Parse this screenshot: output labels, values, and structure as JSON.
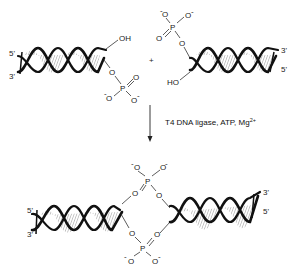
{
  "diagram": {
    "top_left_duplex": {
      "labels": {
        "five_prime": "5'",
        "three_prime": "3'"
      },
      "hydroxyl": "OH",
      "phosphate": {
        "o_bridge": "O",
        "p": "P",
        "o_double": "O",
        "o_minus_1": "O",
        "o_minus_2": "O",
        "charge": "-"
      }
    },
    "plus_sign": "+",
    "top_right_duplex": {
      "labels": {
        "three_prime": "3'",
        "five_prime": "5'"
      },
      "hydroxyl": "HO",
      "phosphate": {
        "o_bridge": "O",
        "p": "P",
        "o_double": "O",
        "o_minus_1": "O",
        "o_minus_2": "O",
        "charge": "-"
      }
    },
    "reaction": {
      "arrow": "down-arrow",
      "conditions": "T4 DNA ligase, ATP, Mg",
      "superscript": "2+"
    },
    "product": {
      "left_labels": {
        "five_prime": "5'",
        "three_prime": "3'"
      },
      "right_labels": {
        "three_prime": "3'",
        "five_prime": "5'"
      },
      "upper_phosphate": {
        "o_left": "O",
        "p": "P",
        "o_right": "O",
        "o_minus_1": "O",
        "o_minus_2": "O"
      },
      "lower_phosphate": {
        "o_left": "O",
        "p": "P",
        "o_right": "O",
        "o_minus_1": "O",
        "o_minus_2": "O"
      },
      "charge": "-"
    }
  }
}
